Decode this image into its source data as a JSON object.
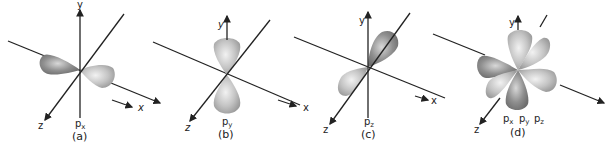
{
  "header": {
    "partial_text": ""
  },
  "panels": [
    {
      "id": "a",
      "caption": "(a)",
      "orbital_label": "p",
      "orbital_sub": "x",
      "axis_x": "x",
      "axis_y": "y",
      "axis_z": "z"
    },
    {
      "id": "b",
      "caption": "(b)",
      "orbital_label": "p",
      "orbital_sub": "y",
      "axis_x": "x",
      "axis_y": "y",
      "axis_z": "z"
    },
    {
      "id": "c",
      "caption": "(c)",
      "orbital_label": "p",
      "orbital_sub": "z",
      "axis_x": "x",
      "axis_y": "y",
      "axis_z": "z"
    },
    {
      "id": "d",
      "caption": "(d)",
      "orbital_labels": [
        "p",
        "p",
        "p"
      ],
      "orbital_subs": [
        "x",
        "y",
        "z"
      ],
      "axis_x": "x",
      "axis_y": "y",
      "axis_z": "z"
    }
  ],
  "colors": {
    "lobe_dark": "#8a8a8a",
    "lobe_light": "#c8c8c8",
    "axis": "#222222"
  }
}
